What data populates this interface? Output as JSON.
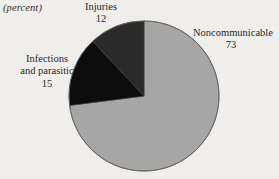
{
  "unit_label": "(percent)",
  "callouts": {
    "injuries": {
      "name": "Injuries",
      "value": "12"
    },
    "infections": {
      "name_line1": "Infections",
      "name_line2": "and parasitic",
      "value": "15"
    },
    "noncommunicable": {
      "name": "Noncommunicable",
      "value": "73"
    }
  },
  "colors": {
    "noncommunicable": "#a8a8a8",
    "infections": "#0d0d0d",
    "injuries": "#2b2b2b",
    "outline": "#5a5a5a",
    "background": "#f2f1ee",
    "text": "#2b2a28"
  },
  "chart_data": {
    "type": "pie",
    "title": "",
    "subtitle": "",
    "xlabel": "",
    "ylabel": "",
    "unit": "percent",
    "legend_position": "callout-labels",
    "grid": false,
    "start_angle_deg": 0,
    "direction": "clockwise",
    "categories": [
      "Noncommunicable",
      "Infections and parasitic",
      "Injuries"
    ],
    "values": [
      73,
      15,
      12
    ],
    "slices": [
      {
        "label": "Noncommunicable",
        "value": 73,
        "color": "#a8a8a8",
        "start_deg": 0,
        "end_deg": 262.8
      },
      {
        "label": "Infections and parasitic",
        "value": 15,
        "color": "#0d0d0d",
        "start_deg": 262.8,
        "end_deg": 316.8
      },
      {
        "label": "Injuries",
        "value": 12,
        "color": "#2b2b2b",
        "start_deg": 316.8,
        "end_deg": 360
      }
    ],
    "total": 100
  }
}
